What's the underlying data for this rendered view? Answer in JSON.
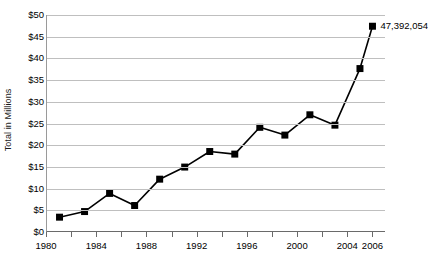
{
  "chart_data": {
    "type": "line",
    "title": "",
    "xlabel": "",
    "ylabel": "Total in Millions",
    "x": [
      1981,
      1983,
      1985,
      1987,
      1989,
      1991,
      1993,
      1995,
      1997,
      1999,
      2001,
      2003,
      2005,
      2006
    ],
    "values": [
      3.2,
      4.5,
      8.7,
      5.9,
      12.0,
      14.8,
      18.4,
      17.8,
      24.0,
      22.2,
      26.9,
      24.5,
      37.6,
      47.4
    ],
    "series": [
      {
        "name": "Total in Millions",
        "values": [
          3.2,
          4.5,
          8.7,
          5.9,
          12.0,
          14.8,
          18.4,
          17.8,
          24.0,
          22.2,
          26.9,
          24.5,
          37.6,
          47.4
        ]
      }
    ],
    "xlim": [
      1980,
      2007
    ],
    "ylim": [
      0,
      50
    ],
    "y_ticks": [
      0,
      5,
      10,
      15,
      20,
      25,
      30,
      35,
      40,
      45,
      50
    ],
    "y_tick_labels": [
      "$0",
      "$5",
      "$10",
      "$15",
      "$20",
      "$25",
      "$30",
      "$35",
      "$40",
      "$45",
      "$50"
    ],
    "x_ticks": [
      1980,
      1982,
      1984,
      1986,
      1988,
      1990,
      1992,
      1994,
      1996,
      1998,
      2000,
      2002,
      2004,
      2006
    ],
    "x_tick_labels": [
      {
        "value": 1980,
        "label": "1980"
      },
      {
        "value": 1984,
        "label": "1984"
      },
      {
        "value": 1988,
        "label": "1988"
      },
      {
        "value": 1992,
        "label": "1992"
      },
      {
        "value": 1996,
        "label": "1996"
      },
      {
        "value": 2000,
        "label": "2000"
      },
      {
        "value": 2004,
        "label": "2004"
      },
      {
        "value": 2006,
        "label": "2006"
      }
    ],
    "grid": true,
    "grid_axis": "y",
    "legend": false,
    "legend_position": "none",
    "annotations": [
      {
        "text": "47,392,054",
        "x": 2006,
        "y": 47.4,
        "anchor": "right-of-point"
      }
    ],
    "marker": "square",
    "marker_color": "#000000",
    "line_color": "#000000",
    "gridline_color": "#bfbfbf",
    "axis_color": "#6a6a6a",
    "background_color": "#ffffff"
  }
}
